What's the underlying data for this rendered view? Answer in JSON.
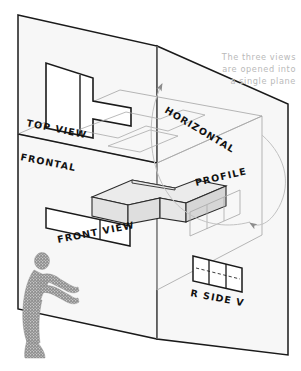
{
  "figure": {
    "title_note": {
      "line1": "The three views",
      "line2": "are opened into",
      "line3": "a single plane",
      "color": "#b9b9b9"
    },
    "plane_labels": {
      "frontal": "FRONTAL",
      "horizontal": "HORIZONTAL",
      "profile": "PROFILE"
    },
    "view_labels": {
      "top": "TOP  VIEW",
      "front": "FRONT  VIEW",
      "right_side": "R  SIDE  V"
    },
    "colors": {
      "plane_fill": "#f7f7f7",
      "plane_edge": "#1a1a1a",
      "ghost_line": "#a9a9a9",
      "object_face_light": "#ebebeb",
      "object_face_mid": "#dedede",
      "object_edge": "#2b2b2b",
      "arc": "#c2c2c2",
      "figure_fill": "#9c9c9c",
      "label_text": "#111111"
    },
    "elements": {
      "person": "person-pushing-plane",
      "object": "stepped-block-solid",
      "arc_top": "rotation-arc-horizontal-plane",
      "arc_right": "rotation-arc-profile-plane"
    }
  }
}
